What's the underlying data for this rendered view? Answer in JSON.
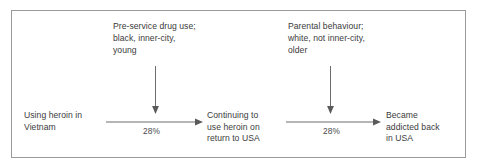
{
  "diagram": {
    "title_text": "",
    "frame": {
      "border_color": "#9a9a9a",
      "background": "#ffffff"
    },
    "text_color": "#3b3b3b",
    "line_color": "#6d6d6d",
    "nodes": [
      {
        "id": "start",
        "label": "Using heroin in\nVietnam"
      },
      {
        "id": "middle",
        "label": "Continuing to\nuse heroin on\nreturn to USA"
      },
      {
        "id": "end",
        "label": "Became\naddicted back\nin USA"
      }
    ],
    "annotations": [
      {
        "id": "left",
        "label": "Pre-service drug use;\nblack, inner-city,\nyoung"
      },
      {
        "id": "right",
        "label": "Parental behaviour;\nwhite, not inner-city,\nolder"
      }
    ],
    "edges": [
      {
        "id": "edge-1",
        "from": "start",
        "to": "middle",
        "label": "28%"
      },
      {
        "id": "edge-2",
        "from": "middle",
        "to": "end",
        "label": "28%"
      }
    ]
  }
}
